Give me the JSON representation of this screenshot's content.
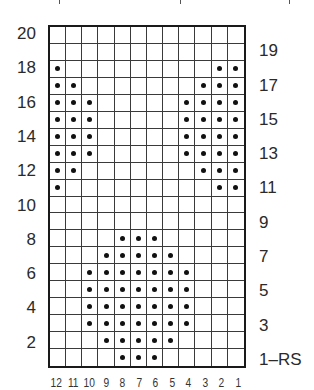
{
  "chart": {
    "columns": 12,
    "rows": 20,
    "column_labels": [
      "12",
      "11",
      "10",
      "9",
      "8",
      "7",
      "6",
      "5",
      "4",
      "3",
      "2",
      "1"
    ],
    "left_row_labels": [
      {
        "row": 20,
        "label": "20"
      },
      {
        "row": 18,
        "label": "18"
      },
      {
        "row": 16,
        "label": "16"
      },
      {
        "row": 14,
        "label": "14"
      },
      {
        "row": 12,
        "label": "12"
      },
      {
        "row": 10,
        "label": "10"
      },
      {
        "row": 8,
        "label": "8"
      },
      {
        "row": 6,
        "label": "6"
      },
      {
        "row": 4,
        "label": "4"
      },
      {
        "row": 2,
        "label": "2"
      }
    ],
    "right_row_labels": [
      {
        "row": 19,
        "label": "19"
      },
      {
        "row": 17,
        "label": "17"
      },
      {
        "row": 15,
        "label": "15"
      },
      {
        "row": 13,
        "label": "13"
      },
      {
        "row": 11,
        "label": "11"
      },
      {
        "row": 9,
        "label": "9"
      },
      {
        "row": 7,
        "label": "7"
      },
      {
        "row": 5,
        "label": "5"
      },
      {
        "row": 3,
        "label": "3"
      },
      {
        "row": 1,
        "label": "1–RS"
      }
    ],
    "dots_by_row": {
      "20": [],
      "19": [],
      "18": [
        12,
        2,
        1
      ],
      "17": [
        12,
        11,
        3,
        2,
        1
      ],
      "16": [
        12,
        11,
        10,
        4,
        3,
        2,
        1
      ],
      "15": [
        12,
        11,
        10,
        4,
        3,
        2,
        1
      ],
      "14": [
        12,
        11,
        10,
        4,
        3,
        2,
        1
      ],
      "13": [
        12,
        11,
        10,
        4,
        3,
        2,
        1
      ],
      "12": [
        12,
        11,
        3,
        2,
        1
      ],
      "11": [
        12,
        2,
        1
      ],
      "10": [],
      "9": [],
      "8": [
        8,
        7,
        6
      ],
      "7": [
        9,
        8,
        7,
        6,
        5
      ],
      "6": [
        10,
        9,
        8,
        7,
        6,
        5,
        4
      ],
      "5": [
        10,
        9,
        8,
        7,
        6,
        5,
        4
      ],
      "4": [
        10,
        9,
        8,
        7,
        6,
        5,
        4
      ],
      "3": [
        10,
        9,
        8,
        7,
        6,
        5,
        4
      ],
      "2": [
        9,
        8,
        7,
        6,
        5
      ],
      "1": [
        8,
        7,
        6
      ]
    },
    "symbol_meaning": "dot",
    "colors": {
      "grid": "#3a3a3a",
      "border": "#1a1a1a",
      "dot": "#111111",
      "text": "#2a2a2a"
    }
  }
}
